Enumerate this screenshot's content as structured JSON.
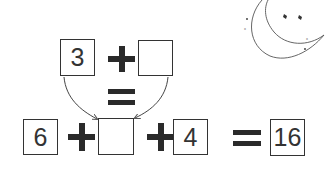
{
  "equation_top": {
    "left_value": "3",
    "operator": "+",
    "right_value": ""
  },
  "connector": {
    "operator": "="
  },
  "equation_bottom": {
    "term1": "6",
    "op1": "+",
    "term2": "",
    "op2": "+",
    "term3": "4",
    "equals": "=",
    "result": "16"
  },
  "decoration": {
    "icon": "crescent-moon-with-stars-icon"
  },
  "colors": {
    "ink": "#2a2a2a",
    "box_border": "#333333",
    "background": "#ffffff"
  }
}
